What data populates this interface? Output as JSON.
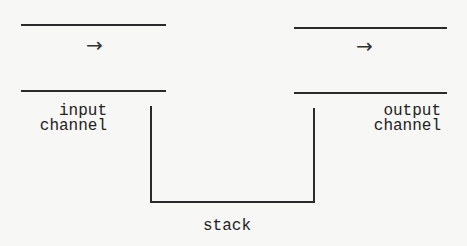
{
  "diagram": {
    "input_channel": {
      "arrow": "→",
      "label_line1": "input",
      "label_line2": "channel"
    },
    "output_channel": {
      "arrow": "→",
      "label_line1": "output",
      "label_line2": "channel"
    },
    "stack": {
      "label": "stack"
    },
    "colors": {
      "background": "#f7f7f5",
      "stroke": "#2a2a2a",
      "text": "#222222"
    }
  }
}
